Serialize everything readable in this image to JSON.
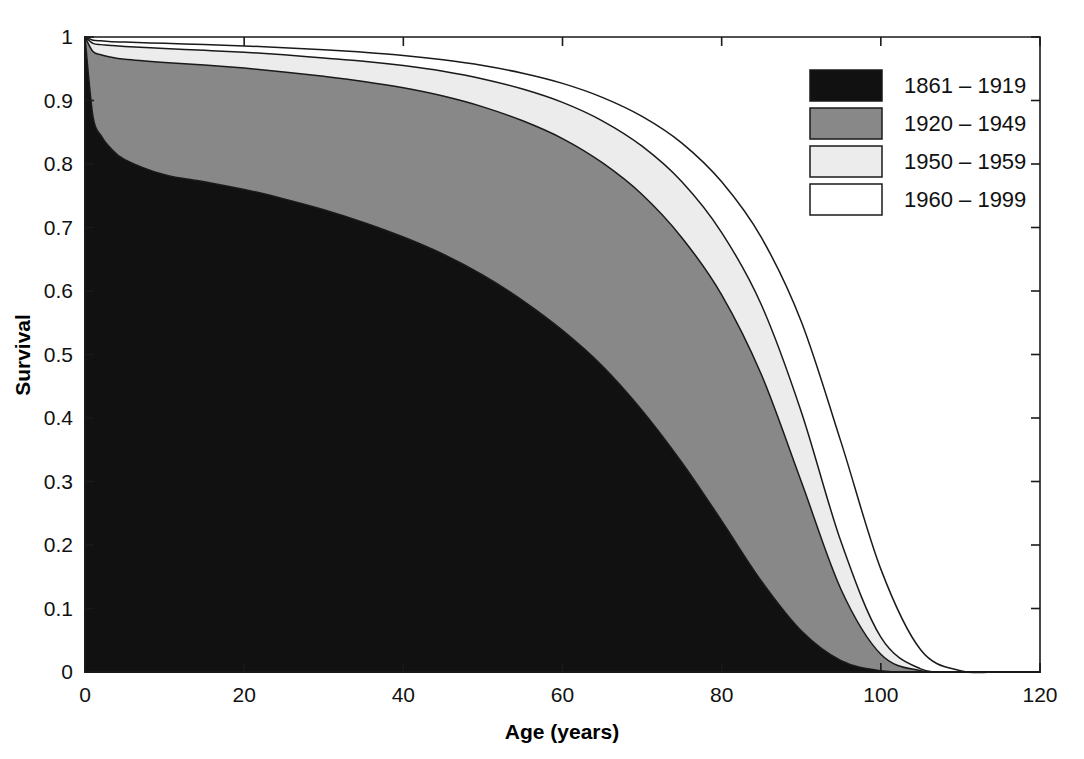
{
  "chart_data": {
    "type": "area",
    "title": "",
    "xlabel": "Age (years)",
    "ylabel": "Survival",
    "xlim": [
      0,
      120
    ],
    "ylim": [
      0,
      1
    ],
    "xticks": [
      0,
      20,
      40,
      60,
      80,
      100,
      120
    ],
    "yticks": [
      0,
      0.1,
      0.2,
      0.3,
      0.4,
      0.5,
      0.6,
      0.7,
      0.8,
      0.9,
      1
    ],
    "xticklabels": [
      "0",
      "20",
      "40",
      "60",
      "80",
      "100",
      "120"
    ],
    "yticklabels": [
      "0",
      "0.1",
      "0.2",
      "0.3",
      "0.4",
      "0.5",
      "0.6",
      "0.7",
      "0.8",
      "0.9",
      "1"
    ],
    "grid": false,
    "legend_position": "top-right",
    "note": "Nested survival curves by birth cohort; each later cohort lies entirely above the earlier one.",
    "x": [
      0,
      1,
      2,
      3,
      5,
      10,
      15,
      20,
      25,
      30,
      35,
      40,
      45,
      50,
      55,
      60,
      65,
      70,
      75,
      80,
      85,
      90,
      95,
      100,
      105,
      110,
      115,
      120
    ],
    "series": [
      {
        "name": "1861 – 1919",
        "color": "#111111",
        "median_survival_age": 72,
        "values": [
          1.0,
          0.875,
          0.845,
          0.828,
          0.807,
          0.783,
          0.772,
          0.76,
          0.745,
          0.728,
          0.708,
          0.685,
          0.658,
          0.625,
          0.585,
          0.538,
          0.482,
          0.412,
          0.33,
          0.238,
          0.143,
          0.065,
          0.018,
          0.002,
          0.0,
          0.0,
          0.0,
          0.0
        ]
      },
      {
        "name": "1920 – 1949",
        "color": "#888888",
        "median_survival_age": 80,
        "values": [
          1.0,
          0.977,
          0.972,
          0.969,
          0.965,
          0.96,
          0.956,
          0.951,
          0.945,
          0.938,
          0.93,
          0.92,
          0.907,
          0.89,
          0.868,
          0.84,
          0.802,
          0.752,
          0.684,
          0.594,
          0.468,
          0.3,
          0.13,
          0.028,
          0.002,
          0.0,
          0.0,
          0.0
        ]
      },
      {
        "name": "1950 – 1959",
        "color": "#ececec",
        "median_survival_age": 83,
        "values": [
          1.0,
          0.99,
          0.988,
          0.987,
          0.985,
          0.982,
          0.979,
          0.976,
          0.972,
          0.967,
          0.962,
          0.955,
          0.946,
          0.934,
          0.918,
          0.897,
          0.868,
          0.828,
          0.772,
          0.692,
          0.578,
          0.41,
          0.205,
          0.055,
          0.005,
          0.0,
          0.0,
          0.0
        ]
      },
      {
        "name": "1960 – 1999",
        "color": "#ffffff",
        "median_survival_age": 87,
        "values": [
          1.0,
          0.995,
          0.994,
          0.993,
          0.992,
          0.99,
          0.988,
          0.986,
          0.983,
          0.98,
          0.976,
          0.971,
          0.964,
          0.955,
          0.943,
          0.927,
          0.905,
          0.875,
          0.833,
          0.772,
          0.684,
          0.552,
          0.362,
          0.162,
          0.035,
          0.002,
          0.0,
          0.0
        ]
      }
    ]
  },
  "legend": {
    "entries": [
      {
        "label": "1861 – 1919",
        "color": "#111111"
      },
      {
        "label": "1920 – 1949",
        "color": "#888888"
      },
      {
        "label": "1950 – 1959",
        "color": "#ececec"
      },
      {
        "label": "1960 – 1999",
        "color": "#ffffff"
      }
    ]
  },
  "colors": {
    "axis": "#1a1a1a",
    "background": "#ffffff",
    "outline": "#1a1a1a"
  }
}
